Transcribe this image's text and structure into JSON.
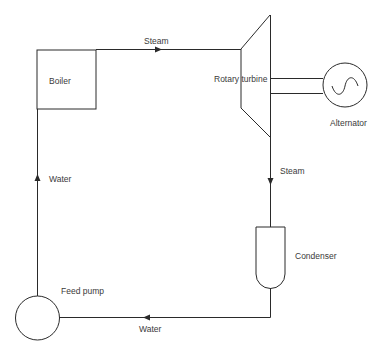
{
  "diagram": {
    "type": "steam power plant cycle",
    "components": {
      "boiler": {
        "label": "Boiler"
      },
      "turbine": {
        "label": "Rotary turbine"
      },
      "alternator": {
        "label": "Alternator"
      },
      "condenser": {
        "label": "Condenser"
      },
      "pump": {
        "label": "Feed pump"
      }
    },
    "flows": {
      "boiler_to_turbine": {
        "label": "Steam"
      },
      "turbine_to_condenser": {
        "label": "Steam"
      },
      "condenser_to_pump": {
        "label": "Water"
      },
      "pump_to_boiler": {
        "label": "Water"
      }
    },
    "colors": {
      "line": "#2a2a2a",
      "text": "#3a3a3a",
      "background": "#ffffff"
    }
  }
}
